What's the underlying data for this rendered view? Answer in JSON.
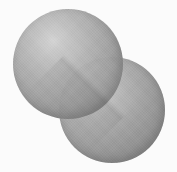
{
  "figure": {
    "kind": "space-filling-molecular-model",
    "rendering_style": "grayscale shaded spheres, scanned halftone",
    "width_px": 177,
    "height_px": 172,
    "background_color": "#fdfdfd",
    "caption": "",
    "title": "",
    "labels": [],
    "visible_text": ""
  },
  "palette": {
    "background": "#fdfdfd",
    "paper_tint": "#fafaf8",
    "highlight": "#c4c4c4",
    "light_midtone": "#a8a8a8",
    "midtone": "#888888",
    "dark_midtone": "#6d6d6d",
    "shadow": "#585858",
    "deep_shadow": "#4c4c4c",
    "seam_shade": "#000000"
  },
  "atoms": [
    {
      "id": "atom-a",
      "position": "upper-left",
      "center_x": 68,
      "center_y": 64,
      "radius": 55,
      "highlight_x_pct": 36,
      "highlight_y_pct": 29,
      "draw_order": "front",
      "element_symbol": "",
      "element_label": ""
    },
    {
      "id": "atom-b",
      "position": "lower-right",
      "center_x": 112,
      "center_y": 110,
      "radius": 53,
      "highlight_x_pct": 33,
      "highlight_y_pct": 28,
      "draw_order": "back",
      "element_symbol": "",
      "element_label": ""
    }
  ],
  "bond": {
    "type": "fused-contact",
    "seam_angle_deg": -45,
    "notch_upper_right_x": 121,
    "notch_upper_right_y": 59,
    "notch_lower_left_x": 60,
    "notch_lower_left_y": 119
  },
  "lighting": {
    "source_direction": "upper-left",
    "shadow_direction": "lower-right"
  }
}
